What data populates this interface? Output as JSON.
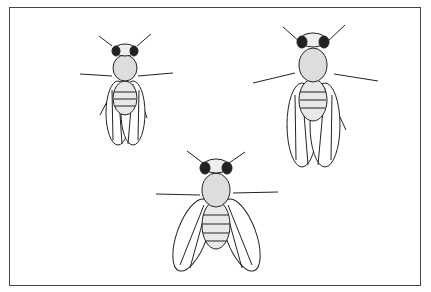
{
  "illustration": {
    "subject": "three fruit flies (Drosophila) line drawing",
    "colors": {
      "ink": "#222222",
      "paper": "#ffffff",
      "frame": "#444444"
    },
    "flies": [
      {
        "id": "fly-top-left",
        "wings": "folded, short"
      },
      {
        "id": "fly-top-right",
        "wings": "folded, long"
      },
      {
        "id": "fly-bottom-center",
        "wings": "spread"
      }
    ]
  }
}
